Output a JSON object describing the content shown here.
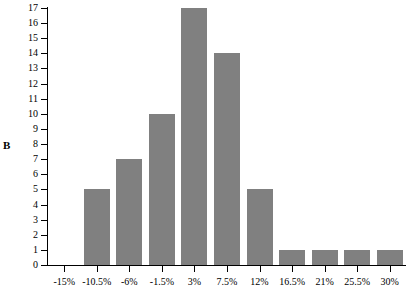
{
  "panel": {
    "label": "B"
  },
  "colors": {
    "bar_fill": "#808080",
    "axis": "#000000",
    "background": "#ffffff"
  },
  "chart_data": {
    "type": "bar",
    "title": "",
    "subtitle": "",
    "xlabel": "",
    "ylabel": "",
    "categories": [
      "-15%",
      "-10.5%",
      "-6%",
      "-1.5%",
      "3%",
      "7.5%",
      "12%",
      "16.5%",
      "21%",
      "25.5%",
      "30%"
    ],
    "values": [
      0,
      5,
      7,
      10,
      17,
      14,
      5,
      1,
      1,
      1,
      1
    ],
    "ylim": [
      0,
      17
    ],
    "y_ticks": [
      0,
      1,
      2,
      3,
      4,
      5,
      6,
      7,
      8,
      9,
      10,
      11,
      12,
      13,
      14,
      15,
      16,
      17
    ],
    "y_tick_labels": [
      "0",
      "1",
      "2",
      "3",
      "4",
      "5",
      "6",
      "7",
      "8",
      "9",
      "10",
      "11",
      "12",
      "13",
      "14",
      "15",
      "16",
      "17"
    ],
    "grid": false,
    "legend": null,
    "legend_position": "none",
    "annotations": [
      "B"
    ],
    "bar_color": "#808080",
    "orientation": "vertical"
  }
}
